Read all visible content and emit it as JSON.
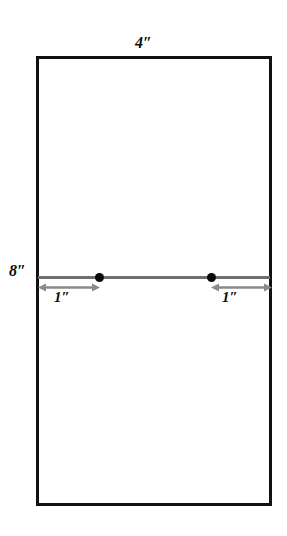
{
  "diagram": {
    "type": "technical-dimension-drawing",
    "background_color": "#ffffff",
    "outline_color": "#111111",
    "line_color": "#6e6e6e",
    "marker_color": "#0a0a0a",
    "panel": {
      "width_label": "4″",
      "height_label": "8″"
    },
    "centerline": {
      "name": "horizontal-center-line"
    },
    "markers": [
      {
        "name": "hole-left"
      },
      {
        "name": "hole-right"
      }
    ],
    "dimensions": [
      {
        "name": "left-edge-to-left-hole",
        "label": "1″"
      },
      {
        "name": "right-hole-to-right-edge",
        "label": "1″"
      }
    ]
  }
}
